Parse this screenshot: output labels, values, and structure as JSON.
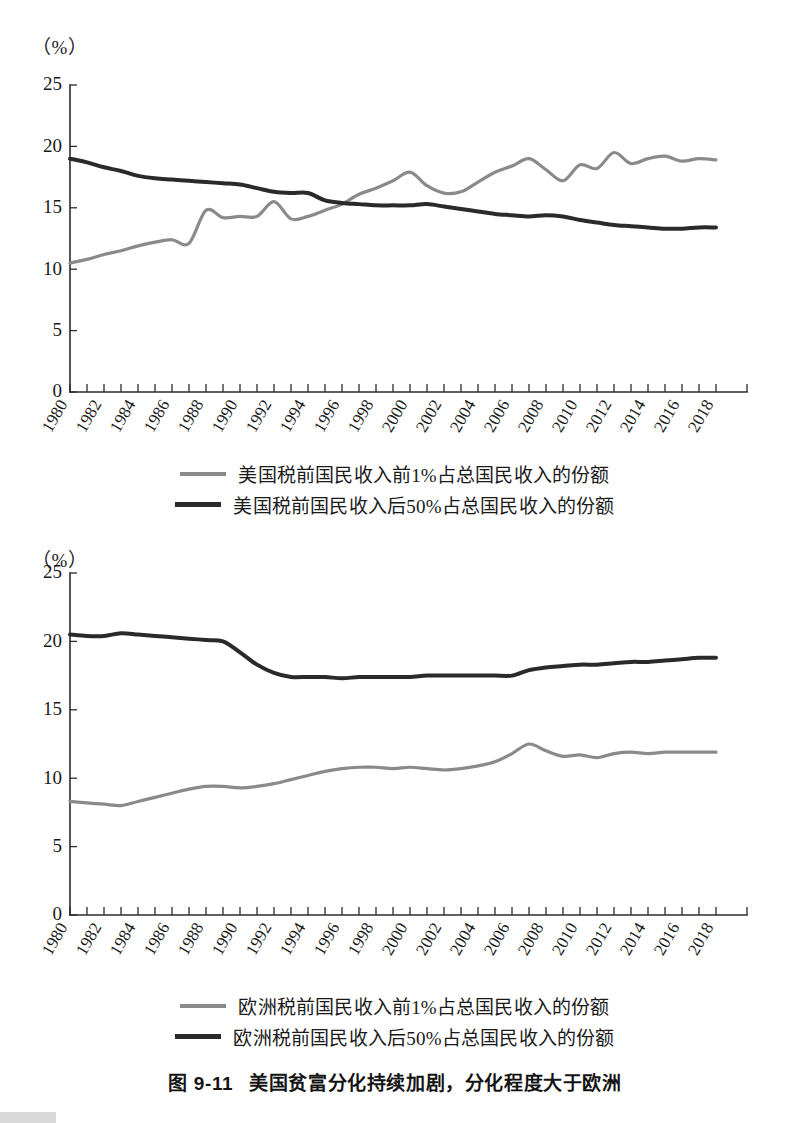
{
  "caption": {
    "figure_number": "图 9-11",
    "text": "美国贫富分化持续加剧，分化程度大于欧洲"
  },
  "chart_data": [
    {
      "id": "us-income-share",
      "type": "line",
      "title": "",
      "unit_label": "（%）",
      "xlabel": "",
      "ylabel": "",
      "ylim": [
        0,
        25
      ],
      "yticks": [
        0,
        5,
        10,
        15,
        20,
        25
      ],
      "ytick_labels": [
        "0",
        "5",
        "10",
        "15",
        "20",
        "25"
      ],
      "xlim": [
        1980,
        2019
      ],
      "xticks": [
        1980,
        1981,
        1982,
        1983,
        1984,
        1985,
        1986,
        1987,
        1988,
        1989,
        1990,
        1991,
        1992,
        1993,
        1994,
        1995,
        1996,
        1997,
        1998,
        1999,
        2000,
        2001,
        2002,
        2003,
        2004,
        2005,
        2006,
        2007,
        2008,
        2009,
        2010,
        2011,
        2012,
        2013,
        2014,
        2015,
        2016,
        2017,
        2018
      ],
      "xtick_labels": [
        "1980",
        "1982",
        "1984",
        "1986",
        "1988",
        "1990",
        "1992",
        "1994",
        "1996",
        "1998",
        "2000",
        "2002",
        "2004",
        "2006",
        "2008",
        "2010",
        "2012",
        "2014",
        "2016",
        "2018"
      ],
      "xtick_label_years": [
        1980,
        1982,
        1984,
        1986,
        1988,
        1990,
        1992,
        1994,
        1996,
        1998,
        2000,
        2002,
        2004,
        2006,
        2008,
        2010,
        2012,
        2014,
        2016,
        2018
      ],
      "grid": false,
      "legend_position": "bottom",
      "x": [
        1980,
        1981,
        1982,
        1983,
        1984,
        1985,
        1986,
        1987,
        1988,
        1989,
        1990,
        1991,
        1992,
        1993,
        1994,
        1995,
        1996,
        1997,
        1998,
        1999,
        2000,
        2001,
        2002,
        2003,
        2004,
        2005,
        2006,
        2007,
        2008,
        2009,
        2010,
        2011,
        2012,
        2013,
        2014,
        2015,
        2016,
        2017,
        2018
      ],
      "series": [
        {
          "name": "美国税前国民收入前1%占总国民收入的份额",
          "color": "#8a8a8a",
          "width": 3.2,
          "values": [
            10.5,
            10.8,
            11.2,
            11.5,
            11.9,
            12.2,
            12.4,
            12.1,
            14.8,
            14.2,
            14.3,
            14.3,
            15.5,
            14.1,
            14.3,
            14.8,
            15.3,
            16.1,
            16.6,
            17.2,
            17.9,
            16.8,
            16.2,
            16.3,
            17.1,
            17.9,
            18.4,
            19.0,
            18.1,
            17.2,
            18.5,
            18.2,
            19.5,
            18.6,
            19.0,
            19.2,
            18.8,
            19.0,
            18.9
          ]
        },
        {
          "name": "美国税前国民收入后50%占总国民收入的份额",
          "color": "#2a2a2a",
          "width": 4.0,
          "values": [
            19.0,
            18.7,
            18.3,
            18.0,
            17.6,
            17.4,
            17.3,
            17.2,
            17.1,
            17.0,
            16.9,
            16.6,
            16.3,
            16.2,
            16.2,
            15.6,
            15.4,
            15.3,
            15.2,
            15.2,
            15.2,
            15.3,
            15.1,
            14.9,
            14.7,
            14.5,
            14.4,
            14.3,
            14.4,
            14.3,
            14.0,
            13.8,
            13.6,
            13.5,
            13.4,
            13.3,
            13.3,
            13.4,
            13.4
          ]
        }
      ]
    },
    {
      "id": "europe-income-share",
      "type": "line",
      "title": "",
      "unit_label": "（%）",
      "xlabel": "",
      "ylabel": "",
      "ylim": [
        0,
        25
      ],
      "yticks": [
        0,
        5,
        10,
        15,
        20,
        25
      ],
      "ytick_labels": [
        "0",
        "5",
        "10",
        "15",
        "20",
        "25"
      ],
      "xlim": [
        1980,
        2019
      ],
      "xticks": [
        1980,
        1981,
        1982,
        1983,
        1984,
        1985,
        1986,
        1987,
        1988,
        1989,
        1990,
        1991,
        1992,
        1993,
        1994,
        1995,
        1996,
        1997,
        1998,
        1999,
        2000,
        2001,
        2002,
        2003,
        2004,
        2005,
        2006,
        2007,
        2008,
        2009,
        2010,
        2011,
        2012,
        2013,
        2014,
        2015,
        2016,
        2017,
        2018
      ],
      "xtick_labels": [
        "1980",
        "1982",
        "1984",
        "1986",
        "1988",
        "1990",
        "1992",
        "1994",
        "1996",
        "1998",
        "2000",
        "2002",
        "2004",
        "2006",
        "2008",
        "2010",
        "2012",
        "2014",
        "2016",
        "2018"
      ],
      "xtick_label_years": [
        1980,
        1982,
        1984,
        1986,
        1988,
        1990,
        1992,
        1994,
        1996,
        1998,
        2000,
        2002,
        2004,
        2006,
        2008,
        2010,
        2012,
        2014,
        2016,
        2018
      ],
      "grid": false,
      "legend_position": "bottom",
      "x": [
        1980,
        1981,
        1982,
        1983,
        1984,
        1985,
        1986,
        1987,
        1988,
        1989,
        1990,
        1991,
        1992,
        1993,
        1994,
        1995,
        1996,
        1997,
        1998,
        1999,
        2000,
        2001,
        2002,
        2003,
        2004,
        2005,
        2006,
        2007,
        2008,
        2009,
        2010,
        2011,
        2012,
        2013,
        2014,
        2015,
        2016,
        2017,
        2018
      ],
      "series": [
        {
          "name": "欧洲税前国民收入前1%占总国民收入的份额",
          "color": "#8a8a8a",
          "width": 3.2,
          "values": [
            8.3,
            8.2,
            8.1,
            8.0,
            8.3,
            8.6,
            8.9,
            9.2,
            9.4,
            9.4,
            9.3,
            9.4,
            9.6,
            9.9,
            10.2,
            10.5,
            10.7,
            10.8,
            10.8,
            10.7,
            10.8,
            10.7,
            10.6,
            10.7,
            10.9,
            11.2,
            11.8,
            12.5,
            12.0,
            11.6,
            11.7,
            11.5,
            11.8,
            11.9,
            11.8,
            11.9,
            11.9,
            11.9,
            11.9
          ]
        },
        {
          "name": "欧洲税前国民收入后50%占总国民收入的份额",
          "color": "#2a2a2a",
          "width": 4.0,
          "values": [
            20.5,
            20.4,
            20.4,
            20.6,
            20.5,
            20.4,
            20.3,
            20.2,
            20.1,
            20.0,
            19.2,
            18.3,
            17.7,
            17.4,
            17.4,
            17.4,
            17.3,
            17.4,
            17.4,
            17.4,
            17.4,
            17.5,
            17.5,
            17.5,
            17.5,
            17.5,
            17.5,
            17.9,
            18.1,
            18.2,
            18.3,
            18.3,
            18.4,
            18.5,
            18.5,
            18.6,
            18.7,
            18.8,
            18.8
          ]
        }
      ]
    }
  ]
}
